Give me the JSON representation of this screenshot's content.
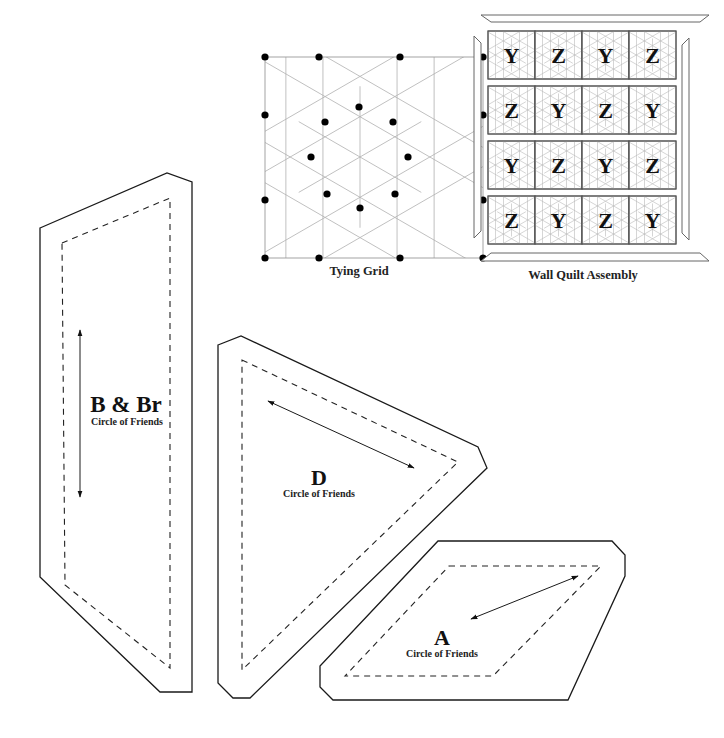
{
  "tying_grid": {
    "caption": "Tying Grid",
    "frame": {
      "x": 265,
      "y": 57,
      "w": 218,
      "h": 201
    },
    "center": {
      "x": 360,
      "y": 157
    },
    "dots": [
      [
        265,
        57
      ],
      [
        319,
        57
      ],
      [
        400,
        57
      ],
      [
        483,
        57
      ],
      [
        265,
        115
      ],
      [
        483,
        115
      ],
      [
        359,
        107
      ],
      [
        325,
        122
      ],
      [
        393,
        122
      ],
      [
        311,
        157
      ],
      [
        408,
        157
      ],
      [
        327,
        194
      ],
      [
        395,
        194
      ],
      [
        360,
        208
      ],
      [
        265,
        200
      ],
      [
        483,
        200
      ],
      [
        265,
        258
      ],
      [
        319,
        258
      ],
      [
        400,
        258
      ],
      [
        483,
        258
      ]
    ]
  },
  "wall_quilt": {
    "caption": "Wall Quilt Assembly",
    "rows": [
      [
        "Y",
        "Z",
        "Y",
        "Z"
      ],
      [
        "Z",
        "Y",
        "Z",
        "Y"
      ],
      [
        "Y",
        "Z",
        "Y",
        "Z"
      ],
      [
        "Z",
        "Y",
        "Z",
        "Y"
      ]
    ],
    "origin": {
      "x": 488,
      "y": 31
    },
    "block_w": 47,
    "block_h": 48,
    "row_gap": 7
  },
  "pieces": {
    "b": {
      "label": "B & Br",
      "sublabel": "Circle of Friends",
      "outline": [
        [
          40,
          228
        ],
        [
          167,
          173
        ],
        [
          192,
          182
        ],
        [
          192,
          692
        ],
        [
          160,
          692
        ],
        [
          40,
          577
        ]
      ],
      "seam": [
        [
          62,
          243
        ],
        [
          170,
          198
        ],
        [
          170,
          668
        ],
        [
          65,
          585
        ]
      ],
      "grain": {
        "x1": 80,
        "y1": 330,
        "x2": 80,
        "y2": 497
      }
    },
    "d": {
      "label": "D",
      "sublabel": "Circle of Friends",
      "outline": [
        [
          218,
          345
        ],
        [
          241,
          336
        ],
        [
          478,
          447
        ],
        [
          487,
          468
        ],
        [
          250,
          698
        ],
        [
          233,
          698
        ],
        [
          218,
          683
        ]
      ],
      "seam": [
        [
          242,
          360
        ],
        [
          458,
          462
        ],
        [
          242,
          670
        ]
      ],
      "grain": {
        "x1": 268,
        "y1": 401,
        "x2": 414,
        "y2": 468
      }
    },
    "a": {
      "label": "A",
      "sublabel": "Circle of Friends",
      "outline": [
        [
          438,
          541
        ],
        [
          612,
          541
        ],
        [
          625,
          555
        ],
        [
          625,
          576
        ],
        [
          568,
          700
        ],
        [
          333,
          700
        ],
        [
          320,
          687
        ],
        [
          320,
          666
        ]
      ],
      "seam": [
        [
          449,
          566
        ],
        [
          601,
          566
        ],
        [
          493,
          676
        ],
        [
          345,
          676
        ]
      ],
      "grain": {
        "x1": 471,
        "y1": 619,
        "x2": 578,
        "y2": 576
      }
    }
  }
}
